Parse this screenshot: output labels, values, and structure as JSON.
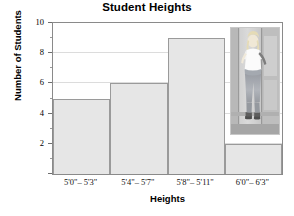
{
  "chart_data": {
    "type": "bar",
    "title": "Student Heights",
    "xlabel": "Heights",
    "ylabel": "Number of Students",
    "categories": [
      "5'0\"– 5'3\"",
      "5'4\"– 5'7\"",
      "5'8\"– 5'11\"",
      "6'0\"– 6'3\""
    ],
    "values": [
      5,
      6,
      9,
      2
    ],
    "ylim": [
      0,
      10
    ],
    "yticks": [
      0,
      2,
      4,
      6,
      8,
      10
    ],
    "ytick_labels": [
      "",
      "2",
      "4",
      "6",
      "8",
      "10"
    ],
    "ytick_minor_step": 1,
    "grid": true,
    "grid_axis": "y",
    "legend": null,
    "bar_color": "#e6e6e6",
    "bar_border_color": "#9a9a9a",
    "gridline_color": "#dcdcdc",
    "axis_color": "#8a8a8a"
  },
  "overlay": {
    "photo_caption": "photo-of-student-standing-against-wall"
  }
}
